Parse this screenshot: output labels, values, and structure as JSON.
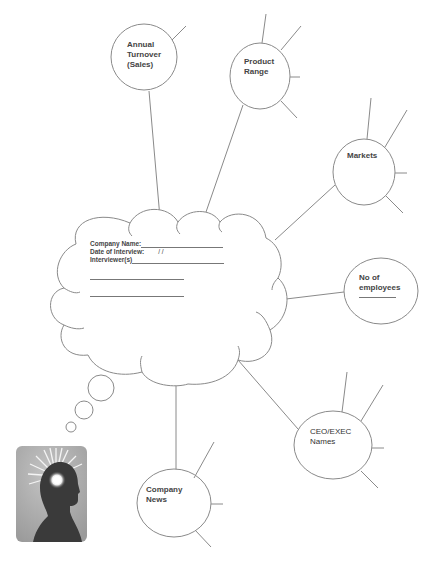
{
  "diagram": {
    "type": "mind-map",
    "central_node": {
      "shape": "thought-cloud",
      "form_fields": [
        {
          "label": "Company Name:",
          "value": ""
        },
        {
          "label": "Date of Interview:",
          "value": "/   /"
        },
        {
          "label": "Interviewer(s)",
          "value": ""
        }
      ],
      "blank_lines": 2
    },
    "nodes": [
      {
        "id": "annual-turnover",
        "label": "Annual\nTurnover\n(Sales)"
      },
      {
        "id": "product-range",
        "label": "Product\nRange"
      },
      {
        "id": "markets",
        "label": "Markets"
      },
      {
        "id": "no-of-employees",
        "label": "No of\nemployees",
        "has_blank": true
      },
      {
        "id": "ceo-exec-names",
        "label": "CEO/EXEC\nNames"
      },
      {
        "id": "company-news",
        "label": "Company\nNews"
      }
    ],
    "illustration": "head-silhouette-with-glowing-mind",
    "colors": {
      "line": "#8a8a8a",
      "text": "#444444",
      "head_bg": "#a9a9a9",
      "head_silhouette": "#3a3a3a",
      "glow": "#ffffff"
    }
  }
}
